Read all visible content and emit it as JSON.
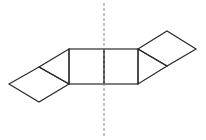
{
  "diagram": {
    "stroke_color": "#2b2b2b",
    "axis_color": "#8a8a8a",
    "axis": {
      "x": 104,
      "y1": 3,
      "y2": 137
    },
    "center_squares": [
      {
        "x": 69,
        "y": 49,
        "w": 35,
        "h": 35
      },
      {
        "x": 104,
        "y": 49,
        "w": 34,
        "h": 35
      }
    ],
    "left_triangle": "69,49 39,67 69,84",
    "left_rhombus": "39,67 9,84 39,102 69,84",
    "right_triangle": "138,49 167,66 138,84",
    "right_rhombus": "138,49 167,31 196,49 167,66"
  }
}
